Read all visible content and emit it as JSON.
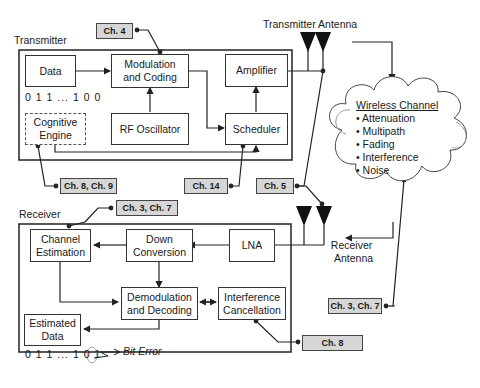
{
  "transmitter": {
    "title": "Transmitter",
    "blocks": {
      "data": "Data",
      "modulation": [
        "Modulation",
        "and Coding"
      ],
      "amplifier": "Amplifier",
      "rf_oscillator": "RF Oscillator",
      "scheduler": "Scheduler",
      "cognitive": [
        "Cognitive",
        "Engine"
      ]
    },
    "bits": "0 1 1 ... 1 0 0"
  },
  "transmitter_antenna": "Transmitter Antenna",
  "receiver_antenna": [
    "Receiver",
    "Antenna"
  ],
  "channel": {
    "title": "Wireless Channel",
    "items": [
      "Attenuation",
      "Multipath",
      "Fading",
      "Interference",
      "Noise"
    ]
  },
  "receiver": {
    "title": "Receiver",
    "blocks": {
      "channel_estimation": [
        "Channel",
        "Estimation"
      ],
      "down_conversion": [
        "Down",
        "Conversion"
      ],
      "lna": "LNA",
      "demodulation": [
        "Demodulation",
        "and Decoding"
      ],
      "interference_cancellation": [
        "Interference",
        "Cancellation"
      ],
      "estimated_data": [
        "Estimated",
        "Data"
      ]
    },
    "bits_prefix": "0 1 1 ... 1 0 ",
    "bits_error": "1",
    "bit_error_label": "Bit Error"
  },
  "chapter_tags": {
    "ch4": "Ch. 4",
    "ch8_9": "Ch. 8, Ch. 9",
    "ch14": "Ch. 14",
    "ch5": "Ch. 5",
    "ch3_7_top": "Ch. 3, Ch. 7",
    "ch3_7_right": "Ch. 3, Ch. 7",
    "ch8": "Ch. 8"
  }
}
